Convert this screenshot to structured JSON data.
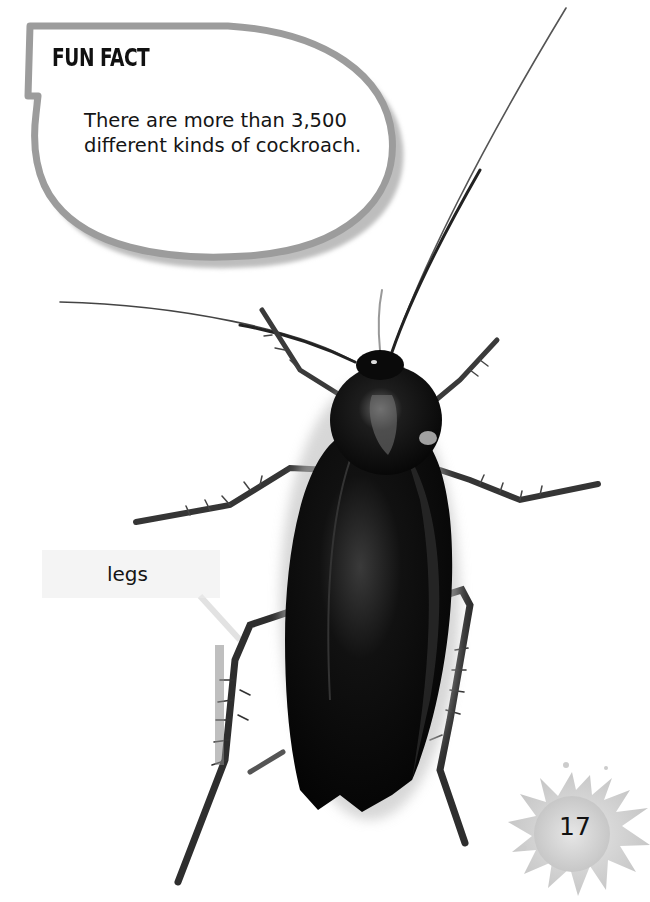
{
  "fun_fact": {
    "title": "FUN FACT",
    "text": "There are more than 3,500 different kinds of cockroach."
  },
  "labels": {
    "legs": "legs"
  },
  "page": {
    "number": "17"
  },
  "image": {
    "subject": "cockroach-photo",
    "colors": {
      "background": "#ffffff",
      "bubble_border": "#9a9a9a",
      "bubble_fill": "#ffffff",
      "insect_body": "#0b0b0b",
      "splat": "#d4d4d4"
    }
  }
}
